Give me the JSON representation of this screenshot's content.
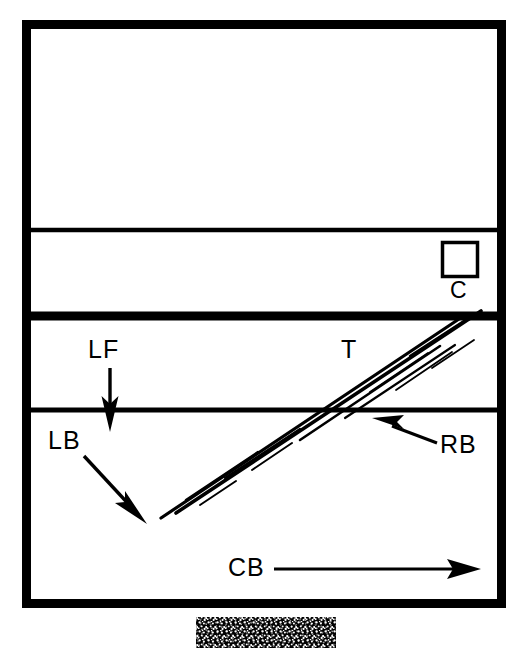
{
  "figure": {
    "type": "technical-line-diagram",
    "background_color": "#ffffff",
    "ink_color": "#000000",
    "frame": {
      "name": "outer-rectangle-frame",
      "x": 22,
      "y": 20,
      "width": 484,
      "height": 588,
      "stroke_width": 9
    },
    "dividers": [
      {
        "name": "upper-thin-divider",
        "y": 230,
        "stroke_width": 4,
        "style": "thin"
      },
      {
        "name": "middle-thick-divider",
        "y": 316,
        "stroke_width": 9,
        "style": "thick"
      },
      {
        "name": "lower-thin-divider",
        "y": 410,
        "stroke_width": 5,
        "style": "thin"
      }
    ],
    "square": {
      "name": "small-square-C",
      "x": 441,
      "y": 241,
      "size": 37,
      "stroke_width": 4
    },
    "diagonal_band": {
      "name": "hatched-diagonal-band",
      "start_x": 160,
      "start_y": 517,
      "end_x": 481,
      "end_y": 311,
      "stripe_count": 4,
      "description": "cluster of parallel thin diagonal strokes rising left-to-right"
    },
    "texture_block": {
      "name": "speckled-texture-block",
      "x": 196,
      "y": 617,
      "width": 140,
      "height": 31,
      "description": "dense black-and-white mottled noise patch below the frame"
    }
  },
  "labels": {
    "lf": "LF",
    "lb": "LB",
    "rb": "RB",
    "t": "T",
    "c": "C",
    "cb": "CB"
  },
  "arrows": [
    {
      "name": "lf-arrow",
      "label": "LF",
      "direction": "down",
      "from_x": 110,
      "from_y": 368,
      "to_x": 110,
      "to_y": 428
    },
    {
      "name": "lb-arrow",
      "label": "LB",
      "direction": "down-right",
      "from_x": 85,
      "from_y": 458,
      "to_x": 145,
      "to_y": 523
    },
    {
      "name": "rb-arrow",
      "label": "RB",
      "direction": "up-left",
      "from_x": 437,
      "from_y": 443,
      "to_x": 374,
      "to_y": 419
    },
    {
      "name": "cb-arrow",
      "label": "CB",
      "direction": "right",
      "from_x": 275,
      "from_y": 569,
      "to_x": 479,
      "to_y": 569
    }
  ]
}
